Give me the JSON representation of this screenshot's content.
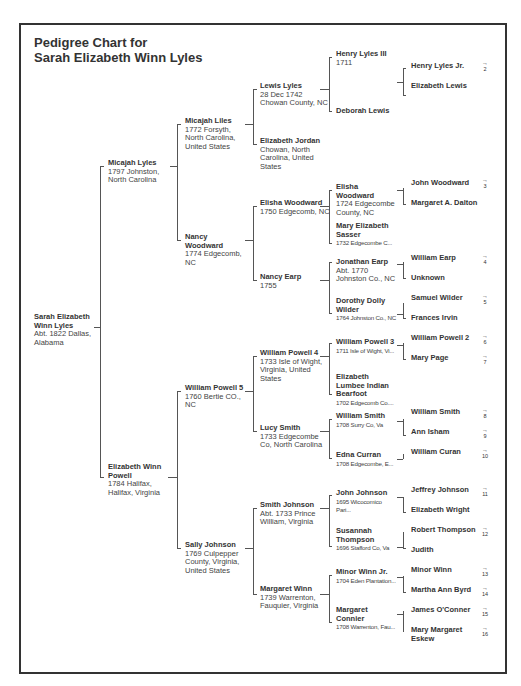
{
  "title": {
    "line1": "Pedigree Chart for",
    "line2": "Sarah Elizabeth Winn Lyles"
  },
  "gen1": {
    "name": "Sarah Elizabeth Winn Lyles",
    "detail": "Abt. 1822 Dallas, Alabama"
  },
  "gen2": [
    {
      "name": "Micajah Lyles",
      "detail": "1797 Johnston, North Carolina"
    },
    {
      "name": "Elizabeth Winn Powell",
      "detail": "1784 Halifax, Halifax, Virginia"
    }
  ],
  "gen3": [
    {
      "name": "Micajah Liles",
      "detail": "1772 Forsyth, North Carolina, United States"
    },
    {
      "name": "Nancy Woodward",
      "detail": "1774 Edgecomb, NC"
    },
    {
      "name": "William Powell 5",
      "detail": "1760 Bertie CO., NC"
    },
    {
      "name": "Sally Johnson",
      "detail": "1769 Culpepper County, Virginia, United States"
    }
  ],
  "gen4": [
    {
      "name": "Lewis Lyles",
      "detail": "28 Dec 1742 Chowan County, NC"
    },
    {
      "name": "Elizabeth Jordan",
      "detail": "Chowan, North Carolina, United States"
    },
    {
      "name": "Elisha Woodward",
      "detail": "1750 Edgecomb, NC"
    },
    {
      "name": "Nancy Earp",
      "detail": "1755"
    },
    {
      "name": "William Powell 4",
      "detail": "1733 Isle of Wight, Virginia, United States"
    },
    {
      "name": "Lucy Smith",
      "detail": "1733 Edgecombe Co, North Carolina"
    },
    {
      "name": "Smith Johnson",
      "detail": "Abt. 1733 Prince William, Virginia"
    },
    {
      "name": "Margaret Winn",
      "detail": "1739 Warrenton, Fauquier, Virginia"
    }
  ],
  "gen5": [
    {
      "name": "Henry Lyles III",
      "detail": "1711"
    },
    {
      "name": "Deborah Lewis",
      "detail": ""
    },
    {
      "name": "Elisha Woodward",
      "detail": "1724 Edgecombe County, NC"
    },
    {
      "name": "Mary Elizabeth Sasser",
      "detail": "1732 Edgecombe C..."
    },
    {
      "name": "Jonathan Earp",
      "detail": "Abt. 1770 Johnston Co., NC"
    },
    {
      "name": "Dorothy Dolly Wilder",
      "detail": "1764 Johnston Co., NC"
    },
    {
      "name": "William Powell 3",
      "detail": "1711 Isle of Wight, Vi..."
    },
    {
      "name": "Elizabeth Lumbee Indian Bearfoot",
      "detail": "1702 Edgecomb Co...."
    },
    {
      "name": "William Smith",
      "detail": "1708 Surry Co, Va"
    },
    {
      "name": "Edna Curran",
      "detail": "1708 Edgecombe, E..."
    },
    {
      "name": "John Johnson",
      "detail": "1695 Wicocomico Pari..."
    },
    {
      "name": "Susannah Thompson",
      "detail": "1696 Stafford Co, Va"
    },
    {
      "name": "Minor Winn Jr.",
      "detail": "1704 Eden Plantation..."
    },
    {
      "name": "Margaret Connier",
      "detail": "1708 Warrenton, Fau..."
    }
  ],
  "gen6": [
    {
      "name": "Henry Lyles Jr.",
      "cont": "2"
    },
    {
      "name": "Elizabeth Lewis",
      "cont": ""
    },
    {
      "name": "John Woodward",
      "cont": "3"
    },
    {
      "name": "Margaret A. Dalton",
      "cont": ""
    },
    {
      "name": "William Earp",
      "cont": "4"
    },
    {
      "name": "Unknown",
      "cont": ""
    },
    {
      "name": "Samuel Wilder",
      "cont": "5"
    },
    {
      "name": "Frances Irvin",
      "cont": ""
    },
    {
      "name": "William Powell 2",
      "cont": "6"
    },
    {
      "name": "Mary Page",
      "cont": "7"
    },
    {
      "name": "William Smith",
      "cont": "8"
    },
    {
      "name": "Ann Isham",
      "cont": "9"
    },
    {
      "name": "William Curan",
      "cont": "10"
    },
    {
      "name": "Jeffrey Johnson",
      "cont": "11"
    },
    {
      "name": "Elizabeth Wright",
      "cont": ""
    },
    {
      "name": "Robert Thompson",
      "cont": "12"
    },
    {
      "name": "Judith",
      "cont": ""
    },
    {
      "name": "Minor Winn",
      "cont": "13"
    },
    {
      "name": "Martha Ann Byrd",
      "cont": "14"
    },
    {
      "name": "James O'Conner",
      "cont": "15"
    },
    {
      "name": "Mary Margaret Eskew",
      "cont": "16"
    }
  ],
  "icons": {
    "continuation_arrow": "→"
  }
}
